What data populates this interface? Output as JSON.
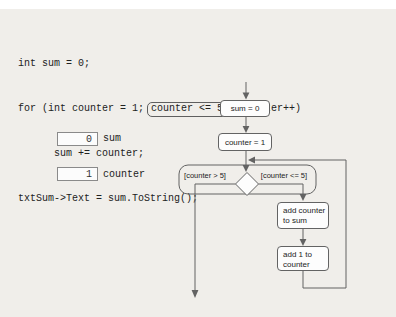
{
  "code": {
    "line1": "int sum = 0;",
    "line2_before": "for (int counter = 1;",
    "line2_boxed": "counter <= 5;",
    "line2_after": " counter++)",
    "line3": "      sum += counter;",
    "line4": "txtSum->Text = sum.ToString();"
  },
  "variables": [
    {
      "value": "0",
      "name": "sum"
    },
    {
      "value": "1",
      "name": "counter"
    }
  ],
  "flowchart": {
    "start_label": "sum = 0",
    "init_label": "counter = 1",
    "exit_guard": "[counter > 5]",
    "loop_guard": "[counter <= 5]",
    "body1": {
      "line1": "add counter",
      "line2": "to sum"
    },
    "body2": {
      "line1": "add 1 to",
      "line2": "counter"
    }
  },
  "colors": {
    "background": "#f0eeea",
    "top_strip": "#ffffff",
    "flow_stroke": "#636363",
    "box_fill": "#fdfdfd",
    "code_text": "#222222"
  }
}
